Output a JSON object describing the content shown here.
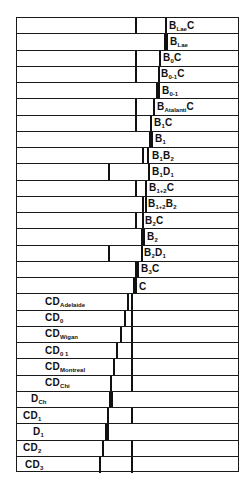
{
  "diagram": {
    "frame": {
      "left": 16,
      "top": 17,
      "right": 239,
      "bottom": 472
    },
    "row_height": 16.25,
    "rows": [
      {
        "base": "B",
        "sub": "Lae",
        "suffix": "C",
        "label_x": 168,
        "bars": [
          {
            "x": 134,
            "w": "thin"
          },
          {
            "x": 164,
            "w": "thin"
          }
        ]
      },
      {
        "base": "B",
        "sub": "Lae",
        "suffix": "",
        "label_x": 169,
        "bars": [
          {
            "x": 163,
            "w": "thick"
          }
        ]
      },
      {
        "base": "B",
        "sub": "0",
        "suffix": "C",
        "label_x": 162,
        "bars": [
          {
            "x": 134,
            "w": "thin"
          },
          {
            "x": 158,
            "w": "thin"
          }
        ]
      },
      {
        "base": "B",
        "sub": "0-1",
        "suffix": "C",
        "label_x": 160,
        "bars": [
          {
            "x": 134,
            "w": "thin"
          },
          {
            "x": 157,
            "w": "thin"
          }
        ]
      },
      {
        "base": "B",
        "sub": "0-1",
        "suffix": "",
        "label_x": 161,
        "bars": [
          {
            "x": 155,
            "w": "thick"
          }
        ]
      },
      {
        "base": "B",
        "sub": "Atalanti",
        "suffix": "C",
        "label_x": 156,
        "bars": [
          {
            "x": 134,
            "w": "thin"
          },
          {
            "x": 152,
            "w": "thin"
          }
        ]
      },
      {
        "base": "B",
        "sub": "1",
        "suffix": "C",
        "label_x": 153,
        "bars": [
          {
            "x": 134,
            "w": "thin"
          },
          {
            "x": 149,
            "w": "thin"
          }
        ]
      },
      {
        "base": "B",
        "sub": "1",
        "suffix": "",
        "label_x": 154,
        "bars": [
          {
            "x": 148,
            "w": "thick"
          }
        ]
      },
      {
        "base": "B",
        "sub": "1",
        "suffix": "B",
        "suffix_sub": "2",
        "label_x": 151,
        "bars": [
          {
            "x": 141,
            "w": "thin"
          },
          {
            "x": 146,
            "w": "thin"
          }
        ]
      },
      {
        "base": "B",
        "sub": "1",
        "suffix": "D",
        "suffix_sub": "1",
        "label_x": 151,
        "bars": [
          {
            "x": 107,
            "w": "thin"
          },
          {
            "x": 147,
            "w": "thin"
          }
        ]
      },
      {
        "base": "B",
        "sub": "1+2",
        "suffix": "C",
        "label_x": 148,
        "bars": [
          {
            "x": 134,
            "w": "thin"
          },
          {
            "x": 144,
            "w": "thin"
          }
        ]
      },
      {
        "base": "B",
        "sub": "1+2",
        "suffix": "B",
        "suffix_sub": "2",
        "label_x": 147,
        "bars": [
          {
            "x": 141,
            "w": "thin"
          },
          {
            "x": 144,
            "w": "thin"
          }
        ]
      },
      {
        "base": "B",
        "sub": "2",
        "suffix": "C",
        "label_x": 144,
        "bars": [
          {
            "x": 134,
            "w": "thin"
          },
          {
            "x": 141,
            "w": "thin"
          }
        ]
      },
      {
        "base": "B",
        "sub": "2",
        "suffix": "",
        "label_x": 146,
        "bars": [
          {
            "x": 140,
            "w": "thick"
          }
        ]
      },
      {
        "base": "B",
        "sub": "2",
        "suffix": "D",
        "suffix_sub": "1",
        "label_x": 143,
        "bars": [
          {
            "x": 107,
            "w": "thin"
          },
          {
            "x": 140,
            "w": "thin"
          }
        ]
      },
      {
        "base": "B",
        "sub": "3",
        "suffix": "C",
        "label_x": 140,
        "bars": [
          {
            "x": 134,
            "w": "thin"
          },
          {
            "x": 136,
            "w": "thin"
          }
        ]
      },
      {
        "base": "C",
        "sub": "",
        "suffix": "",
        "label_x": 138,
        "bars": [
          {
            "x": 132,
            "w": "thick"
          }
        ]
      },
      {
        "base": "CD",
        "sub": "Adelaide",
        "suffix": "",
        "label_x": 44,
        "bars": [
          {
            "x": 126,
            "w": "thin"
          },
          {
            "x": 130,
            "w": "thin"
          }
        ]
      },
      {
        "base": "CD",
        "sub": "0",
        "suffix": "",
        "label_x": 44,
        "bars": [
          {
            "x": 123,
            "w": "thin"
          },
          {
            "x": 130,
            "w": "thin"
          }
        ]
      },
      {
        "base": "CD",
        "sub": "Wigan",
        "suffix": "",
        "label_x": 44,
        "bars": [
          {
            "x": 119,
            "w": "thin"
          },
          {
            "x": 130,
            "w": "thin"
          }
        ]
      },
      {
        "base": "CD",
        "sub": "0 1",
        "suffix": "",
        "label_x": 44,
        "bars": [
          {
            "x": 115,
            "w": "thin"
          },
          {
            "x": 130,
            "w": "thin"
          }
        ]
      },
      {
        "base": "CD",
        "sub": "Montreal",
        "suffix": "",
        "label_x": 44,
        "bars": [
          {
            "x": 112,
            "w": "thin"
          },
          {
            "x": 130,
            "w": "thin"
          }
        ]
      },
      {
        "base": "CD",
        "sub": "Chi",
        "suffix": "",
        "label_x": 44,
        "bars": [
          {
            "x": 109,
            "w": "thin"
          },
          {
            "x": 130,
            "w": "thin"
          }
        ]
      },
      {
        "base": "D",
        "sub": "Ch",
        "suffix": "",
        "label_x": 30,
        "bars": [
          {
            "x": 108,
            "w": "thick"
          }
        ]
      },
      {
        "base": "CD",
        "sub": "1",
        "suffix": "",
        "label_x": 22,
        "bars": [
          {
            "x": 106,
            "w": "thin"
          },
          {
            "x": 130,
            "w": "thin"
          }
        ]
      },
      {
        "base": "D",
        "sub": "1",
        "suffix": "",
        "label_x": 32,
        "bars": [
          {
            "x": 104,
            "w": "thick"
          }
        ]
      },
      {
        "base": "CD",
        "sub": "2",
        "suffix": "",
        "label_x": 22,
        "bars": [
          {
            "x": 101,
            "w": "thin"
          },
          {
            "x": 130,
            "w": "thin"
          }
        ]
      },
      {
        "base": "CD",
        "sub": "3",
        "suffix": "",
        "label_x": 24,
        "bars": [
          {
            "x": 98,
            "w": "thin"
          },
          {
            "x": 130,
            "w": "thin"
          }
        ]
      }
    ]
  }
}
